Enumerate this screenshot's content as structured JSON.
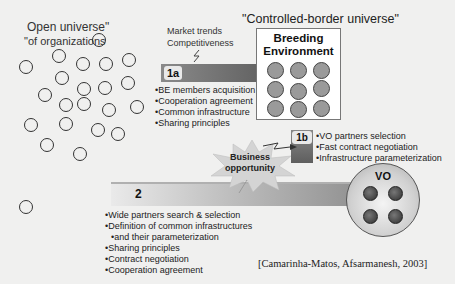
{
  "open_universe": {
    "title_line1": "Open universe\"",
    "title_line2": "\"of organizations",
    "circles": [
      {
        "x": 98,
        "y": 39
      },
      {
        "x": 58,
        "y": 55
      },
      {
        "x": 25,
        "y": 66
      },
      {
        "x": 82,
        "y": 63
      },
      {
        "x": 105,
        "y": 63
      },
      {
        "x": 128,
        "y": 59
      },
      {
        "x": 61,
        "y": 77
      },
      {
        "x": 44,
        "y": 94
      },
      {
        "x": 83,
        "y": 88
      },
      {
        "x": 104,
        "y": 87
      },
      {
        "x": 127,
        "y": 82
      },
      {
        "x": 65,
        "y": 104
      },
      {
        "x": 83,
        "y": 103
      },
      {
        "x": 108,
        "y": 109
      },
      {
        "x": 136,
        "y": 106
      },
      {
        "x": 30,
        "y": 124
      },
      {
        "x": 65,
        "y": 123
      },
      {
        "x": 97,
        "y": 129
      },
      {
        "x": 117,
        "y": 133
      },
      {
        "x": 46,
        "y": 144
      },
      {
        "x": 79,
        "y": 153
      },
      {
        "x": 25,
        "y": 206
      }
    ]
  },
  "controlled_title": "\"Controlled-border universe\"",
  "market": {
    "line1": "Market trends",
    "line2": "Competitiveness"
  },
  "phase_1a": {
    "badge": "1a",
    "items": [
      "BE members acquisition",
      "Cooperation agreement",
      "Common infrastructure",
      "Sharing principles"
    ]
  },
  "breeding_environment": {
    "title_line1": "Breeding",
    "title_line2": "Environment",
    "members_grid": "3x3"
  },
  "phase_1b": {
    "badge": "1b",
    "items": [
      "VO partners selection",
      "Fast contract negotiation",
      "Infrastructure parameterization"
    ]
  },
  "business_opportunity": {
    "line1": "Business",
    "line2": "opportunity"
  },
  "phase_2": {
    "badge": "2",
    "items": [
      "Wide partners search & selection",
      "Definition of common infrastructures",
      "and their parameterization",
      "Sharing principles",
      "Contract negotiation",
      "Cooperation agreement"
    ]
  },
  "vo": {
    "label": "VO",
    "members": 4
  },
  "citation": "[Camarinha-Matos, Afsarmanesh, 2003]",
  "colors": {
    "bar_dark": "#5e5e5e",
    "member_fill": "#9a9a9a",
    "vo_member_fill": "#3d3d3d",
    "background": "#f0f0ef"
  }
}
